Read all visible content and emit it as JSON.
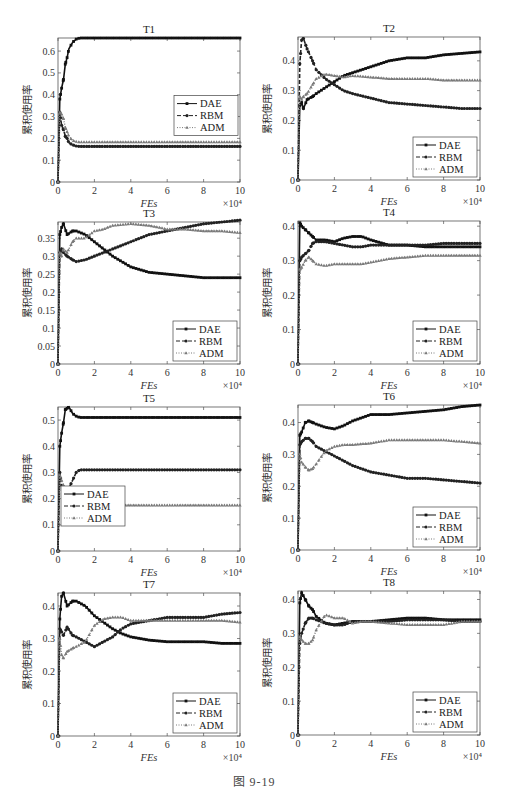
{
  "figure": {
    "caption": "图 9-19",
    "ylabel": "累积使用率",
    "xlabel": "FEs",
    "x_multiplier": "×10⁴",
    "legend": [
      "DAE",
      "RBM",
      "ADM"
    ]
  },
  "chart_data": [
    {
      "type": "line",
      "title": "T1",
      "xlabel": "FEs",
      "ylabel": "累积使用率",
      "x_multiplier": "×10^4",
      "xlim": [
        0,
        10
      ],
      "ylim": [
        0,
        0.66
      ],
      "yticks": [
        0,
        0.1,
        0.2,
        0.3,
        0.4,
        0.5,
        0.6
      ],
      "xticks": [
        0,
        2,
        4,
        6,
        8,
        10
      ],
      "legend_position": "right-middle",
      "x": [
        0,
        0.1,
        0.2,
        0.3,
        0.4,
        0.5,
        0.6,
        0.8,
        1.0,
        1.2,
        1.5,
        2,
        3,
        4,
        5,
        6,
        7,
        8,
        9,
        10
      ],
      "series": [
        {
          "name": "DAE",
          "values": [
            0,
            0.38,
            0.43,
            0.47,
            0.54,
            0.57,
            0.61,
            0.64,
            0.655,
            0.66,
            0.66,
            0.66,
            0.66,
            0.66,
            0.66,
            0.66,
            0.66,
            0.66,
            0.66,
            0.66
          ]
        },
        {
          "name": "RBM",
          "values": [
            0,
            0.32,
            0.26,
            0.24,
            0.21,
            0.2,
            0.18,
            0.17,
            0.165,
            0.163,
            0.163,
            0.163,
            0.163,
            0.163,
            0.163,
            0.163,
            0.163,
            0.163,
            0.163,
            0.163
          ]
        },
        {
          "name": "ADM",
          "values": [
            0,
            0.32,
            0.31,
            0.29,
            0.25,
            0.23,
            0.21,
            0.19,
            0.185,
            0.183,
            0.183,
            0.183,
            0.183,
            0.183,
            0.183,
            0.183,
            0.183,
            0.183,
            0.183,
            0.183
          ]
        }
      ]
    },
    {
      "type": "line",
      "title": "T2",
      "xlabel": "FEs",
      "ylabel": "累积使用率",
      "x_multiplier": "×10^4",
      "xlim": [
        0,
        10
      ],
      "ylim": [
        0,
        0.48
      ],
      "yticks": [
        0,
        0.1,
        0.2,
        0.3,
        0.4
      ],
      "xticks": [
        0,
        2,
        4,
        6,
        8,
        10
      ],
      "legend_position": "lower-right",
      "x": [
        0,
        0.1,
        0.2,
        0.3,
        0.5,
        0.8,
        1.0,
        1.5,
        2,
        2.5,
        3,
        4,
        5,
        6,
        7,
        8,
        9,
        10
      ],
      "series": [
        {
          "name": "DAE",
          "values": [
            0,
            0.25,
            0.26,
            0.24,
            0.27,
            0.28,
            0.29,
            0.31,
            0.33,
            0.35,
            0.36,
            0.38,
            0.4,
            0.41,
            0.41,
            0.42,
            0.425,
            0.43
          ]
        },
        {
          "name": "RBM",
          "values": [
            0,
            0.39,
            0.47,
            0.475,
            0.44,
            0.4,
            0.37,
            0.34,
            0.32,
            0.3,
            0.29,
            0.275,
            0.26,
            0.255,
            0.25,
            0.245,
            0.24,
            0.24
          ]
        },
        {
          "name": "ADM",
          "values": [
            0,
            0.28,
            0.27,
            0.28,
            0.29,
            0.32,
            0.34,
            0.355,
            0.35,
            0.345,
            0.35,
            0.345,
            0.34,
            0.34,
            0.34,
            0.335,
            0.335,
            0.335
          ]
        }
      ]
    },
    {
      "type": "line",
      "title": "T3",
      "xlabel": "FEs",
      "ylabel": "累积使用率",
      "x_multiplier": "×10^4",
      "xlim": [
        0,
        10
      ],
      "ylim": [
        0,
        0.395
      ],
      "yticks": [
        0,
        0.05,
        0.1,
        0.15,
        0.2,
        0.25,
        0.3,
        0.35
      ],
      "xticks": [
        0,
        2,
        4,
        6,
        8,
        10
      ],
      "legend_position": "lower-right",
      "x": [
        0,
        0.1,
        0.2,
        0.3,
        0.5,
        0.8,
        1.0,
        1.5,
        2,
        2.5,
        3,
        4,
        5,
        6,
        7,
        8,
        9,
        10
      ],
      "series": [
        {
          "name": "DAE",
          "values": [
            0,
            0.36,
            0.38,
            0.39,
            0.36,
            0.37,
            0.37,
            0.36,
            0.34,
            0.32,
            0.3,
            0.27,
            0.255,
            0.25,
            0.245,
            0.24,
            0.24,
            0.24
          ]
        },
        {
          "name": "RBM",
          "values": [
            0,
            0.31,
            0.32,
            0.31,
            0.3,
            0.29,
            0.285,
            0.29,
            0.3,
            0.31,
            0.32,
            0.34,
            0.36,
            0.37,
            0.38,
            0.39,
            0.395,
            0.4
          ]
        },
        {
          "name": "ADM",
          "values": [
            0,
            0.31,
            0.3,
            0.32,
            0.31,
            0.34,
            0.35,
            0.35,
            0.37,
            0.375,
            0.385,
            0.39,
            0.385,
            0.375,
            0.375,
            0.37,
            0.37,
            0.365
          ]
        }
      ]
    },
    {
      "type": "line",
      "title": "T4",
      "xlabel": "FEs",
      "ylabel": "累积使用率",
      "x_multiplier": "×10^4",
      "xlim": [
        0,
        10
      ],
      "ylim": [
        0,
        0.415
      ],
      "yticks": [
        0,
        0.1,
        0.2,
        0.3,
        0.4
      ],
      "xticks": [
        0,
        2,
        4,
        6,
        8,
        10
      ],
      "legend_position": "lower-right",
      "x": [
        0,
        0.1,
        0.2,
        0.4,
        0.6,
        0.8,
        1.0,
        1.5,
        2,
        2.5,
        3,
        3.5,
        4,
        5,
        6,
        7,
        8,
        9,
        10
      ],
      "series": [
        {
          "name": "DAE",
          "values": [
            0,
            0.41,
            0.4,
            0.39,
            0.38,
            0.37,
            0.36,
            0.36,
            0.355,
            0.365,
            0.37,
            0.37,
            0.36,
            0.345,
            0.345,
            0.34,
            0.34,
            0.34,
            0.34
          ]
        },
        {
          "name": "RBM",
          "values": [
            0,
            0.3,
            0.31,
            0.32,
            0.33,
            0.35,
            0.355,
            0.355,
            0.35,
            0.345,
            0.34,
            0.34,
            0.345,
            0.345,
            0.345,
            0.345,
            0.35,
            0.35,
            0.35
          ]
        },
        {
          "name": "ADM",
          "values": [
            0,
            0.275,
            0.28,
            0.3,
            0.31,
            0.3,
            0.29,
            0.285,
            0.29,
            0.29,
            0.29,
            0.29,
            0.295,
            0.305,
            0.31,
            0.315,
            0.315,
            0.315,
            0.315
          ]
        }
      ]
    },
    {
      "type": "line",
      "title": "T5",
      "xlabel": "FEs",
      "ylabel": "累积使用率",
      "x_multiplier": "×10^4",
      "xlim": [
        0,
        10
      ],
      "ylim": [
        0,
        0.55
      ],
      "yticks": [
        0,
        0.1,
        0.2,
        0.3,
        0.4,
        0.5
      ],
      "xticks": [
        0,
        2,
        4,
        6,
        8,
        10
      ],
      "legend_position": "lower-left",
      "x": [
        0,
        0.1,
        0.2,
        0.3,
        0.4,
        0.5,
        0.6,
        0.8,
        1.0,
        1.2,
        1.5,
        2,
        4,
        6,
        8,
        10
      ],
      "series": [
        {
          "name": "DAE",
          "values": [
            0,
            0.4,
            0.45,
            0.49,
            0.54,
            0.545,
            0.55,
            0.525,
            0.515,
            0.51,
            0.51,
            0.51,
            0.51,
            0.51,
            0.51,
            0.51
          ]
        },
        {
          "name": "RBM",
          "values": [
            0,
            0.3,
            0.25,
            0.24,
            0.23,
            0.22,
            0.24,
            0.27,
            0.3,
            0.31,
            0.31,
            0.31,
            0.31,
            0.31,
            0.31,
            0.31
          ]
        },
        {
          "name": "ADM",
          "values": [
            0,
            0.29,
            0.27,
            0.25,
            0.22,
            0.2,
            0.19,
            0.18,
            0.175,
            0.175,
            0.175,
            0.175,
            0.175,
            0.175,
            0.175,
            0.175
          ]
        }
      ]
    },
    {
      "type": "line",
      "title": "T6",
      "xlabel": "FEs",
      "ylabel": "累积使用率",
      "x_multiplier": "×10^4",
      "xlim": [
        0,
        10
      ],
      "ylim": [
        0,
        0.455
      ],
      "yticks": [
        0,
        0.1,
        0.2,
        0.3,
        0.4
      ],
      "xticks": [
        0,
        2,
        4,
        6,
        8,
        10
      ],
      "legend_position": "lower-right",
      "x": [
        0,
        0.1,
        0.2,
        0.4,
        0.6,
        0.8,
        1.0,
        1.5,
        2,
        2.5,
        3,
        4,
        5,
        6,
        7,
        8,
        9,
        10
      ],
      "series": [
        {
          "name": "DAE",
          "values": [
            0,
            0.36,
            0.37,
            0.4,
            0.405,
            0.4,
            0.395,
            0.385,
            0.38,
            0.39,
            0.405,
            0.425,
            0.425,
            0.43,
            0.435,
            0.44,
            0.45,
            0.455
          ]
        },
        {
          "name": "RBM",
          "values": [
            0,
            0.33,
            0.34,
            0.35,
            0.35,
            0.34,
            0.325,
            0.31,
            0.295,
            0.28,
            0.265,
            0.245,
            0.235,
            0.225,
            0.225,
            0.22,
            0.215,
            0.21
          ]
        },
        {
          "name": "ADM",
          "values": [
            0,
            0.3,
            0.275,
            0.26,
            0.25,
            0.255,
            0.27,
            0.31,
            0.325,
            0.33,
            0.33,
            0.335,
            0.345,
            0.345,
            0.345,
            0.345,
            0.34,
            0.335
          ]
        }
      ]
    },
    {
      "type": "line",
      "title": "T7",
      "xlabel": "FEs",
      "ylabel": "累积使用率",
      "x_multiplier": "×10^4",
      "xlim": [
        0,
        10
      ],
      "ylim": [
        0,
        0.44
      ],
      "yticks": [
        0,
        0.1,
        0.2,
        0.3,
        0.4
      ],
      "xticks": [
        0,
        2,
        4,
        6,
        8,
        10
      ],
      "legend_position": "lower-right",
      "x": [
        0,
        0.1,
        0.2,
        0.3,
        0.5,
        0.8,
        1.0,
        1.5,
        2,
        2.5,
        3,
        3.5,
        4,
        5,
        6,
        7,
        8,
        9,
        10
      ],
      "series": [
        {
          "name": "DAE",
          "values": [
            0,
            0.36,
            0.43,
            0.44,
            0.4,
            0.415,
            0.415,
            0.4,
            0.37,
            0.35,
            0.33,
            0.315,
            0.305,
            0.295,
            0.29,
            0.29,
            0.29,
            0.285,
            0.285
          ]
        },
        {
          "name": "RBM",
          "values": [
            0,
            0.33,
            0.32,
            0.31,
            0.335,
            0.31,
            0.305,
            0.29,
            0.275,
            0.29,
            0.305,
            0.33,
            0.345,
            0.355,
            0.365,
            0.365,
            0.365,
            0.375,
            0.38
          ]
        },
        {
          "name": "ADM",
          "values": [
            0,
            0.3,
            0.25,
            0.24,
            0.26,
            0.27,
            0.275,
            0.29,
            0.34,
            0.36,
            0.365,
            0.365,
            0.355,
            0.355,
            0.355,
            0.355,
            0.355,
            0.355,
            0.35
          ]
        }
      ]
    },
    {
      "type": "line",
      "title": "T8",
      "xlabel": "FEs",
      "ylabel": "累积使用率",
      "x_multiplier": "×10^4",
      "xlim": [
        0,
        10
      ],
      "ylim": [
        0,
        0.425
      ],
      "yticks": [
        0,
        0.1,
        0.2,
        0.3,
        0.4
      ],
      "xticks": [
        0,
        2,
        4,
        6,
        8,
        10
      ],
      "legend_position": "lower-right",
      "x": [
        0,
        0.1,
        0.2,
        0.4,
        0.6,
        0.8,
        1.0,
        1.5,
        2,
        2.5,
        3,
        3.5,
        4,
        5,
        6,
        7,
        8,
        9,
        10
      ],
      "series": [
        {
          "name": "DAE",
          "values": [
            0,
            0.39,
            0.42,
            0.4,
            0.38,
            0.37,
            0.35,
            0.33,
            0.325,
            0.33,
            0.335,
            0.335,
            0.335,
            0.34,
            0.345,
            0.345,
            0.34,
            0.34,
            0.34
          ]
        },
        {
          "name": "RBM",
          "values": [
            0,
            0.27,
            0.3,
            0.33,
            0.345,
            0.345,
            0.34,
            0.33,
            0.325,
            0.325,
            0.335,
            0.335,
            0.335,
            0.335,
            0.34,
            0.34,
            0.34,
            0.335,
            0.335
          ]
        },
        {
          "name": "ADM",
          "values": [
            0,
            0.29,
            0.28,
            0.27,
            0.27,
            0.28,
            0.31,
            0.355,
            0.345,
            0.345,
            0.33,
            0.335,
            0.335,
            0.33,
            0.325,
            0.325,
            0.325,
            0.335,
            0.335
          ]
        }
      ]
    }
  ],
  "layout": {
    "panels": [
      {
        "x0": 58,
        "y0": 38,
        "x1": 240,
        "y1": 182
      },
      {
        "x0": 298,
        "y0": 37,
        "x1": 480,
        "y1": 180
      },
      {
        "x0": 58,
        "y0": 222,
        "x1": 240,
        "y1": 364
      },
      {
        "x0": 298,
        "y0": 221,
        "x1": 480,
        "y1": 364
      },
      {
        "x0": 58,
        "y0": 407,
        "x1": 240,
        "y1": 551
      },
      {
        "x0": 298,
        "y0": 405,
        "x1": 480,
        "y1": 550
      },
      {
        "x0": 58,
        "y0": 593,
        "x1": 240,
        "y1": 736
      },
      {
        "x0": 298,
        "y0": 591,
        "x1": 480,
        "y1": 735
      }
    ],
    "series_styles": [
      {
        "color": "#111111",
        "dash": "",
        "marker": "square",
        "width": 1.6
      },
      {
        "color": "#222222",
        "dash": "4,2",
        "marker": "circle",
        "width": 1.6
      },
      {
        "color": "#7a7a7a",
        "dash": "1,1.5",
        "marker": "triangle",
        "width": 1.4
      }
    ]
  }
}
